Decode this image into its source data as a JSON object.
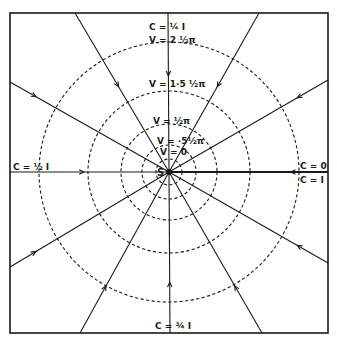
{
  "diagram": {
    "frame": {
      "x": 10,
      "y": 13,
      "width": 318,
      "height": 320
    },
    "source": {
      "label": "S",
      "x": 169,
      "y": 172
    },
    "equipotentials": {
      "style": "dashed",
      "radii": [
        13,
        27,
        48,
        81,
        130
      ]
    },
    "rays": [
      {
        "to": [
          75,
          13
        ],
        "arrow_at": 0.55
      },
      {
        "to": [
          168,
          13
        ],
        "arrow_at": 0.62
      },
      {
        "to": [
          259,
          13
        ],
        "arrow_at": 0.55
      },
      {
        "to": [
          328,
          80
        ],
        "arrow_at": 0.82
      },
      {
        "to": [
          328,
          172
        ],
        "arrow_at": 0.78,
        "thick": true
      },
      {
        "to": [
          328,
          263
        ],
        "arrow_at": 0.82
      },
      {
        "to": [
          262,
          333
        ],
        "arrow_at": 0.72
      },
      {
        "to": [
          170,
          333
        ],
        "arrow_at": 0.7
      },
      {
        "to": [
          80,
          333
        ],
        "arrow_at": 0.72
      },
      {
        "to": [
          10,
          267
        ],
        "arrow_at": 0.85
      },
      {
        "to": [
          10,
          172
        ],
        "arrow_at": 0.55
      },
      {
        "to": [
          10,
          82
        ],
        "arrow_at": 0.85
      }
    ],
    "labels": {
      "top_c": "C = ¼ I",
      "top_v": "V = 2 ½π",
      "v_1_5": "V = 1·5 ½π",
      "v_half": "V = ½π",
      "v_0_5": "V = ·5½π",
      "v_0": "V = 0",
      "left_c": "C = ½ I",
      "right_c0": "C = 0",
      "right_c1": "C = I",
      "bottom_c": "C = ¾ I",
      "source": "S"
    },
    "colors": {
      "ink": "#1a1a1a",
      "paper": "#ffffff"
    }
  }
}
